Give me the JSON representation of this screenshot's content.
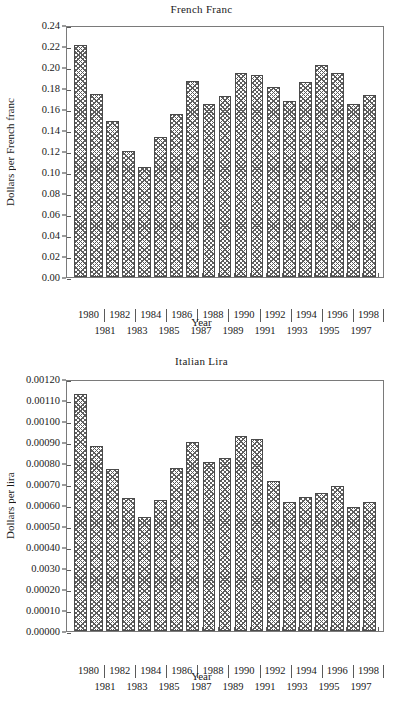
{
  "figure": {
    "background": "#ffffff",
    "bar_edge_color": "#4a4a4a",
    "bar_pattern_color": "#5d5d5d",
    "axis_color": "#7a7a7a"
  },
  "charts": [
    {
      "id": "french-franc",
      "chart_data": {
        "type": "bar",
        "title": "French Franc",
        "xlabel": "Year",
        "ylabel": "Dollars per French franc",
        "categories": [
          "1980",
          "1981",
          "1982",
          "1983",
          "1984",
          "1985",
          "1986",
          "1987",
          "1988",
          "1989",
          "1990",
          "1991",
          "1992",
          "1993",
          "1994",
          "1995",
          "1996",
          "1997",
          "1998"
        ],
        "values": [
          0.221,
          0.174,
          0.149,
          0.12,
          0.105,
          0.133,
          0.155,
          0.187,
          0.165,
          0.172,
          0.194,
          0.192,
          0.181,
          0.168,
          0.186,
          0.202,
          0.194,
          0.165,
          0.173
        ],
        "ylim": [
          0.0,
          0.24
        ],
        "ytick_values": [
          0.0,
          0.02,
          0.04,
          0.06,
          0.08,
          0.1,
          0.12,
          0.14,
          0.16,
          0.18,
          0.2,
          0.22,
          0.24
        ],
        "ytick_labels": [
          "0.00",
          "0.02",
          "0.04",
          "0.06",
          "0.08",
          "0.10",
          "0.12",
          "0.14",
          "0.16",
          "0.18",
          "0.20",
          "0.22",
          "0.24"
        ],
        "xtick_labels_top": [
          "1980",
          "1982",
          "1984",
          "1986",
          "1988",
          "1990",
          "1992",
          "1994",
          "1996",
          "1998"
        ],
        "xtick_labels_bottom": [
          "1981",
          "1983",
          "1985",
          "1987",
          "1989",
          "1991",
          "1993",
          "1995",
          "1997"
        ],
        "grid": false,
        "legend": null
      }
    },
    {
      "id": "italian-lira",
      "chart_data": {
        "type": "bar",
        "title": "Italian Lira",
        "xlabel": "Year",
        "ylabel": "Dollars per lira",
        "categories": [
          "1980",
          "1981",
          "1982",
          "1983",
          "1984",
          "1985",
          "1986",
          "1987",
          "1988",
          "1989",
          "1990",
          "1991",
          "1992",
          "1993",
          "1994",
          "1995",
          "1996",
          "1997",
          "1998"
        ],
        "values": [
          0.001128,
          0.00088,
          0.00077,
          0.000635,
          0.000545,
          0.000622,
          0.000775,
          0.000901,
          0.000805,
          0.000825,
          0.000928,
          0.000912,
          0.000712,
          0.000613,
          0.00064,
          0.000658,
          0.00069,
          0.000592,
          0.000615
        ],
        "ylim": [
          0.0,
          0.0012
        ],
        "ytick_values": [
          0.0,
          0.0001,
          0.0002,
          0.0003,
          0.0004,
          0.0005,
          0.0006,
          0.0007,
          0.0008,
          0.0009,
          0.001,
          0.0011,
          0.0012
        ],
        "ytick_labels": [
          "0.00000",
          "0.00010",
          "0.00020",
          "0.0030",
          "0.00040",
          "0.00050",
          "0.00060",
          "0.00070",
          "0.00080",
          "0.00090",
          "0.00100",
          "0.00110",
          "0.00120"
        ],
        "xtick_labels_top": [
          "1980",
          "1982",
          "1984",
          "1986",
          "1988",
          "1990",
          "1992",
          "1994",
          "1996",
          "1998"
        ],
        "xtick_labels_bottom": [
          "1981",
          "1983",
          "1985",
          "1987",
          "1989",
          "1991",
          "1993",
          "1995",
          "1997"
        ],
        "grid": false,
        "legend": null
      }
    }
  ]
}
